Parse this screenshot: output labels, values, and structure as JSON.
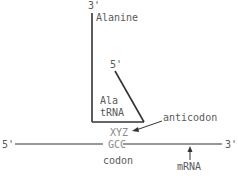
{
  "diagram": {
    "trna": {
      "three_prime": "3'",
      "amino_acid": "Alanine",
      "five_prime": "5'",
      "name_line1": "Ala",
      "name_line2": "tRNA",
      "anticodon_seq": "XYZ",
      "anticodon_label": "anticodon"
    },
    "mrna": {
      "five_prime": "5'",
      "codon_seq": "GCC",
      "three_prime": "3'",
      "codon_label": "codon",
      "label": "mRNA"
    },
    "colors": {
      "line": "#333333",
      "text": "#5a5a5a",
      "faint_text": "#8a8a8a"
    }
  }
}
